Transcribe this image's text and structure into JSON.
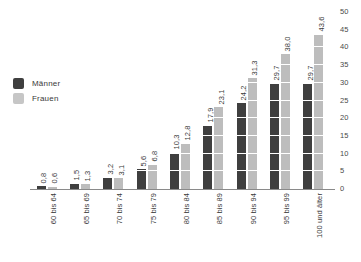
{
  "legend": {
    "position": "inside-top-left",
    "entries": [
      {
        "label": "Männer",
        "color": "#3f3f3f",
        "key": "men"
      },
      {
        "label": "Frauen",
        "color": "#c6c6c6",
        "key": "women"
      }
    ]
  },
  "chart_data": {
    "type": "bar",
    "title": "",
    "subtitle": "",
    "xlabel": "",
    "ylabel": "",
    "ylim": [
      0,
      50
    ],
    "ytick_step": 5,
    "yticks": [
      "0",
      "5",
      "10",
      "15",
      "20",
      "25",
      "30",
      "35",
      "40",
      "45",
      "50"
    ],
    "y_axis_position": "right",
    "grid": false,
    "decimal_separator": ",",
    "categories": [
      "60 bis 64",
      "65 bis 69",
      "70 bis 74",
      "75 bis 79",
      "80 bis 84",
      "85 bis 89",
      "90 bis 94",
      "95 bis 99",
      "100 und älter"
    ],
    "series": [
      {
        "name": "Männer",
        "color": "#3f3f3f",
        "values": [
          0.8,
          1.5,
          3.2,
          5.6,
          10.3,
          17.9,
          24.2,
          29.7,
          29.7
        ],
        "labels": [
          "0,8",
          "1,5",
          "3,2",
          "5,6",
          "10,3",
          "17,9",
          "24,2",
          "29,7",
          "29,7"
        ]
      },
      {
        "name": "Frauen",
        "color": "#bdbdbd",
        "values": [
          0.6,
          1.3,
          3.1,
          6.8,
          12.8,
          23.1,
          31.3,
          38.0,
          43.6
        ],
        "labels": [
          "0,6",
          "1,3",
          "3,1",
          "6,8",
          "12,8",
          "23,1",
          "31,3",
          "38,0",
          "43,6"
        ]
      }
    ]
  }
}
